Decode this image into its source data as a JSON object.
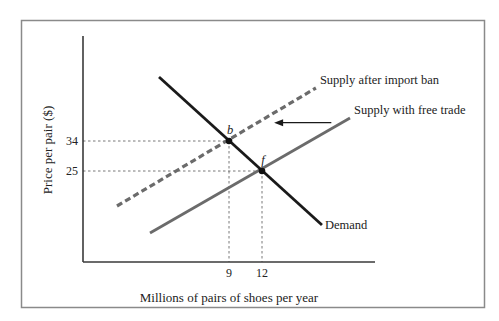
{
  "chart_data": {
    "type": "line",
    "title": "",
    "xlabel": "Millions of pairs of shoes per year",
    "ylabel": "Price per pair ($)",
    "xlim": [
      -4.27,
      22.27
    ],
    "ylim": [
      -2.3,
      65.5
    ],
    "grid": false,
    "x_ticks": [
      {
        "value": 9,
        "label": "9"
      },
      {
        "value": 12,
        "label": "12"
      }
    ],
    "y_ticks": [
      {
        "value": 34,
        "label": "34"
      },
      {
        "value": 25,
        "label": "25"
      }
    ],
    "series": [
      {
        "name": "Demand",
        "label": "Demand",
        "style": "solid",
        "color": "#1a1a1a",
        "points": [
          [
            2.64,
            53.2
          ],
          [
            17.45,
            8.8
          ]
        ]
      },
      {
        "name": "Supply after import ban",
        "label": "Supply after import ban",
        "style": "dashed",
        "color": "#6b6b6b",
        "points": [
          [
            -1.18,
            14.5
          ],
          [
            16.9,
            49.9
          ]
        ]
      },
      {
        "name": "Supply with free trade",
        "label": "Supply with free trade",
        "style": "solid",
        "color": "#6b6b6b",
        "points": [
          [
            1.82,
            6.4
          ],
          [
            20.0,
            40.9
          ]
        ]
      }
    ],
    "equilibria": [
      {
        "name": "b",
        "label": "b",
        "x": 9,
        "y": 34
      },
      {
        "name": "f",
        "label": "f",
        "x": 12,
        "y": 25
      }
    ],
    "annotations": [
      {
        "type": "arrow",
        "direction": "left",
        "from": [
          18.3,
          39.5
        ],
        "to": [
          13.1,
          39.5
        ],
        "meaning": "supply shifts left after import ban"
      }
    ]
  }
}
